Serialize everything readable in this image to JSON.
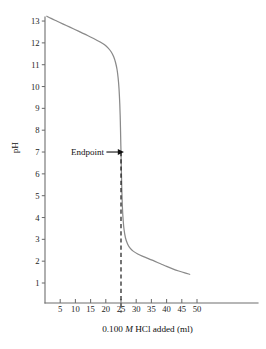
{
  "chart_data": {
    "type": "line",
    "title": "",
    "xlabel_prefix": "0.100",
    "xlabel_molarity": "M",
    "xlabel_suffix": "HCl added (ml)",
    "xlabel": "0.100 M HCl added (ml)",
    "ylabel": "pH",
    "xlim": [
      0,
      53
    ],
    "ylim": [
      0,
      13.6
    ],
    "xticks": [
      5,
      10,
      15,
      20,
      25,
      30,
      35,
      40,
      45,
      50
    ],
    "yticks": [
      1,
      2,
      3,
      4,
      5,
      6,
      7,
      8,
      9,
      10,
      11,
      12,
      13
    ],
    "xtick_labels": [
      "5",
      "10",
      "15",
      "20",
      "25",
      "30",
      "35",
      "40",
      "45",
      "50"
    ],
    "ytick_labels": [
      "1",
      "2",
      "3",
      "4",
      "5",
      "6",
      "7",
      "8",
      "9",
      "10",
      "11",
      "12",
      "13"
    ],
    "grid": false,
    "legend": false,
    "curve_color": "#8a8a8a",
    "axis_color": "#6e6e6e",
    "annotation_color": "#111111",
    "series": [
      {
        "name": "Titration of strong base with 0.100 M HCl",
        "points": [
          [
            0.6,
            13.22
          ],
          [
            2.0,
            13.12
          ],
          [
            4.0,
            12.99
          ],
          [
            6.0,
            12.86
          ],
          [
            8.0,
            12.73
          ],
          [
            10.0,
            12.6
          ],
          [
            12.0,
            12.47
          ],
          [
            14.0,
            12.34
          ],
          [
            16.0,
            12.2
          ],
          [
            18.0,
            12.05
          ],
          [
            19.5,
            11.92
          ],
          [
            20.8,
            11.76
          ],
          [
            21.8,
            11.58
          ],
          [
            22.6,
            11.36
          ],
          [
            23.2,
            11.1
          ],
          [
            23.7,
            10.78
          ],
          [
            24.05,
            10.4
          ],
          [
            24.35,
            9.9
          ],
          [
            24.6,
            9.2
          ],
          [
            24.78,
            8.4
          ],
          [
            24.9,
            7.6
          ],
          [
            25.0,
            7.0
          ],
          [
            25.1,
            6.3
          ],
          [
            25.25,
            5.4
          ],
          [
            25.45,
            4.5
          ],
          [
            25.7,
            3.9
          ],
          [
            26.0,
            3.45
          ],
          [
            26.5,
            3.05
          ],
          [
            27.2,
            2.78
          ],
          [
            28.0,
            2.6
          ],
          [
            29.0,
            2.46
          ],
          [
            30.5,
            2.33
          ],
          [
            32.0,
            2.23
          ],
          [
            34.0,
            2.12
          ],
          [
            36.0,
            2.0
          ],
          [
            38.0,
            1.88
          ],
          [
            40.0,
            1.76
          ],
          [
            42.0,
            1.65
          ],
          [
            44.0,
            1.55
          ],
          [
            46.0,
            1.46
          ],
          [
            47.6,
            1.4
          ]
        ]
      }
    ],
    "annotations": [
      {
        "name": "endpoint",
        "label": "Endpoint",
        "x": 25,
        "y": 7.0,
        "text_x": 12.5,
        "arrow_from_x": 20.2,
        "arrow_to_x": 24.6,
        "dashed_line": true,
        "dash_top_y": 7.0,
        "dash_bottom_y": -0.35
      }
    ]
  }
}
